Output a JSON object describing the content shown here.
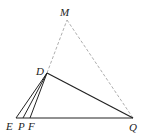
{
  "diagram": {
    "type": "geometry",
    "points": {
      "M": {
        "label": "M",
        "x": 67,
        "y": 20,
        "lx": 60,
        "ly": 16
      },
      "D": {
        "label": "D",
        "x": 47,
        "y": 73,
        "lx": 36,
        "ly": 74
      },
      "E": {
        "label": "E",
        "x": 16,
        "y": 118,
        "lx": 5,
        "ly": 130
      },
      "P": {
        "label": "P",
        "x": 23,
        "y": 118,
        "lx": 18,
        "ly": 130
      },
      "F": {
        "label": "F",
        "x": 30,
        "y": 118,
        "lx": 27,
        "ly": 130
      },
      "Q": {
        "label": "Q",
        "x": 133,
        "y": 118,
        "lx": 130,
        "ly": 131
      }
    },
    "solid_segments": [
      "DE",
      "DP",
      "DF",
      "DQ",
      "EQ"
    ],
    "dashed_segments": [
      "DM",
      "MQ"
    ],
    "colors": {
      "stroke": "#222222",
      "dashed": "#999999"
    }
  }
}
